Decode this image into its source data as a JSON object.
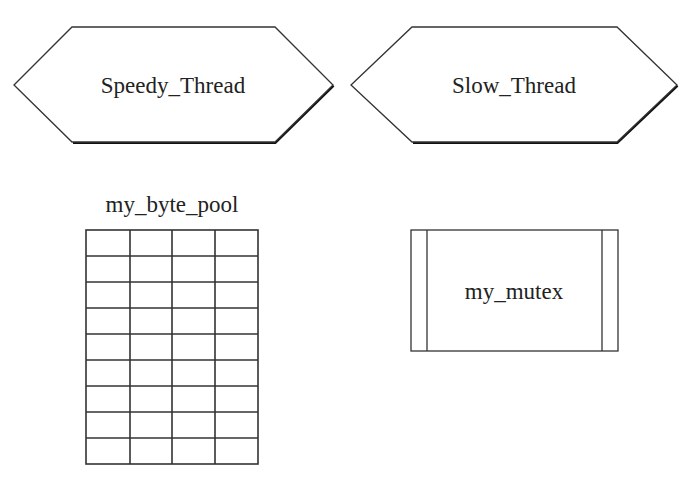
{
  "diagram": {
    "threads": [
      {
        "label": "Speedy_Thread"
      },
      {
        "label": "Slow_Thread"
      }
    ],
    "byte_pool": {
      "label": "my_byte_pool",
      "columns": 4,
      "rows": 9
    },
    "mutex": {
      "label": "my_mutex"
    }
  },
  "colors": {
    "stroke": "#333333",
    "shadow": "#111111",
    "text": "#222222",
    "background": "#ffffff"
  }
}
